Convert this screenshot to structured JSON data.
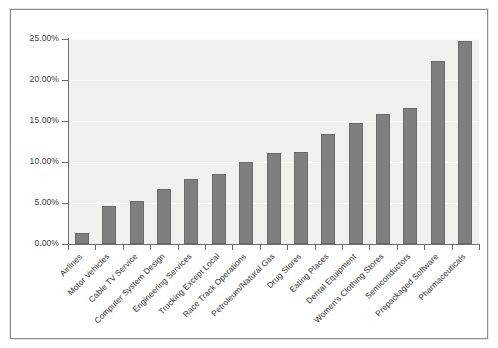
{
  "chart_data": {
    "type": "bar",
    "title": "",
    "subtitle": "",
    "xlabel": "",
    "ylabel": "",
    "ylim": [
      0,
      25
    ],
    "grid": true,
    "legend": false,
    "legend_position": "none",
    "y_tick_labels": [
      "0.00%",
      "5.00%",
      "10.00%",
      "15.00%",
      "20.00%",
      "25.00%"
    ],
    "y_tick_values": [
      0,
      5,
      10,
      15,
      20,
      25
    ],
    "categories": [
      "Airlines",
      "Motor Vehicles",
      "Cable TV Service",
      "Computer System Design",
      "Engineering Services",
      "Trucking Except Local",
      "Race Track Operations",
      "Petroleum/Natural Gas",
      "Drug Stores",
      "Eating Places",
      "Dental Equipment",
      "Women's Clothing Stores",
      "Semiconductors",
      "Prepackaged Software",
      "Pharmaceuticals"
    ],
    "values": [
      1.4,
      4.6,
      5.3,
      6.7,
      7.9,
      8.5,
      10.0,
      11.1,
      11.2,
      13.4,
      14.7,
      15.8,
      16.6,
      22.3,
      24.8
    ],
    "bar_color": "#7f7f7f",
    "bar_edge_color": "#6a6a6a",
    "plot_background": "#f0f0ef",
    "gridline_color": "#fbfbfa",
    "axis_color": "#6d6d6d",
    "frame_color": "#8e8e8e",
    "page_background": "#ffffff"
  }
}
